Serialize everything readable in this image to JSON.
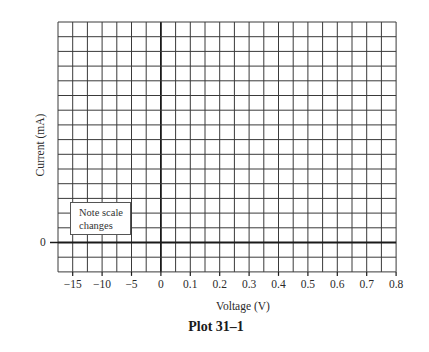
{
  "chart_data": {
    "type": "line",
    "title": "Plot 31–1",
    "xlabel": "Voltage (V)",
    "ylabel": "Current (mA)",
    "x_tick_labels": [
      "−15",
      "−10",
      "−5",
      "0",
      "0.1",
      "0.2",
      "0.3",
      "0.4",
      "0.5",
      "0.6",
      "0.7",
      "0.8"
    ],
    "y_tick_labels": [
      "0"
    ],
    "annotation": "Note scale changes",
    "grid": true,
    "grid_columns": 23,
    "grid_rows": 17,
    "series": []
  },
  "labels": {
    "title": "Plot 31–1",
    "xlabel": "Voltage (V)",
    "ylabel": "Current (mA)",
    "y_zero": "0",
    "note_line1": "Note scale",
    "note_line2": "changes",
    "x_ticks": [
      "−15",
      "−10",
      "−5",
      "0",
      "0.1",
      "0.2",
      "0.3",
      "0.4",
      "0.5",
      "0.6",
      "0.7",
      "0.8"
    ]
  },
  "colors": {
    "grid": "#3a3a3a",
    "axis": "#1a1a1a",
    "background": "#ffffff"
  }
}
